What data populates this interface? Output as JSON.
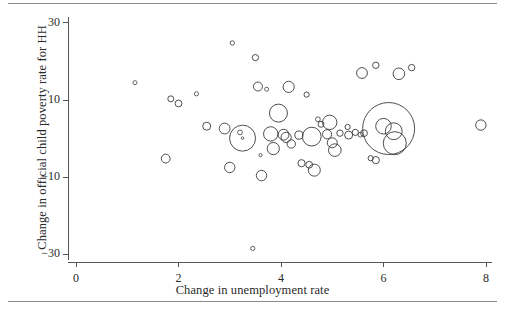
{
  "chart_data": {
    "type": "scatter",
    "title": "",
    "subtitle": "",
    "xlabel": "Change in unemployment rate",
    "ylabel": "Change in official child poverty rate for HH",
    "xlim": [
      -0.35,
      8.4
    ],
    "ylim": [
      -33,
      33
    ],
    "xticks": [
      0,
      2,
      4,
      6,
      8
    ],
    "xtick_labels": [
      "0",
      "2",
      "4",
      "6",
      "8"
    ],
    "yticks": [
      30,
      10,
      -10,
      -30
    ],
    "ytick_labels": [
      "30",
      "10",
      "−10",
      "−30"
    ],
    "grid": false,
    "legend": null,
    "marker_style": "open-circle",
    "size_encodes": "population weight (bubble area)",
    "points": [
      {
        "x": 1.15,
        "y": 14.5,
        "r": 2.0
      },
      {
        "x": 1.85,
        "y": 10.3,
        "r": 3.0
      },
      {
        "x": 2.0,
        "y": 9.1,
        "r": 3.4
      },
      {
        "x": 1.75,
        "y": -5.2,
        "r": 4.4
      },
      {
        "x": 2.35,
        "y": 11.6,
        "r": 2.1
      },
      {
        "x": 2.55,
        "y": 3.2,
        "r": 4.0
      },
      {
        "x": 2.9,
        "y": 2.6,
        "r": 5.4
      },
      {
        "x": 3.0,
        "y": -7.5,
        "r": 5.2
      },
      {
        "x": 3.05,
        "y": 24.8,
        "r": 2.2
      },
      {
        "x": 3.2,
        "y": 1.6,
        "r": 2.4
      },
      {
        "x": 3.25,
        "y": 0.1,
        "r": 13.0
      },
      {
        "x": 3.25,
        "y": 0.1,
        "r": 1.3
      },
      {
        "x": 3.45,
        "y": -28.5,
        "r": 2.1
      },
      {
        "x": 3.5,
        "y": 21.0,
        "r": 3.1
      },
      {
        "x": 3.55,
        "y": 13.5,
        "r": 4.5
      },
      {
        "x": 3.62,
        "y": -9.6,
        "r": 5.2
      },
      {
        "x": 3.6,
        "y": -4.3,
        "r": 1.6
      },
      {
        "x": 3.72,
        "y": 12.8,
        "r": 2.0
      },
      {
        "x": 3.8,
        "y": 1.2,
        "r": 7.2
      },
      {
        "x": 3.85,
        "y": -2.6,
        "r": 6.1
      },
      {
        "x": 3.95,
        "y": 6.6,
        "r": 9.0
      },
      {
        "x": 4.05,
        "y": 1.0,
        "r": 5.4
      },
      {
        "x": 4.1,
        "y": 0.3,
        "r": 5.1
      },
      {
        "x": 4.15,
        "y": 13.4,
        "r": 5.6
      },
      {
        "x": 4.2,
        "y": -1.4,
        "r": 4.2
      },
      {
        "x": 4.35,
        "y": 0.9,
        "r": 4.1
      },
      {
        "x": 4.4,
        "y": -6.4,
        "r": 3.6
      },
      {
        "x": 4.55,
        "y": -6.8,
        "r": 3.4
      },
      {
        "x": 4.5,
        "y": 11.4,
        "r": 2.6
      },
      {
        "x": 4.6,
        "y": 0.5,
        "r": 9.4
      },
      {
        "x": 4.65,
        "y": -8.2,
        "r": 6.0
      },
      {
        "x": 4.72,
        "y": 5.0,
        "r": 2.4
      },
      {
        "x": 4.78,
        "y": 3.7,
        "r": 3.0
      },
      {
        "x": 4.9,
        "y": 1.1,
        "r": 4.6
      },
      {
        "x": 4.95,
        "y": 4.2,
        "r": 7.2
      },
      {
        "x": 5.0,
        "y": -1.1,
        "r": 5.0
      },
      {
        "x": 5.05,
        "y": -3.0,
        "r": 6.3
      },
      {
        "x": 5.15,
        "y": 1.4,
        "r": 3.2
      },
      {
        "x": 5.3,
        "y": 3.0,
        "r": 2.6
      },
      {
        "x": 5.32,
        "y": 0.9,
        "r": 4.0
      },
      {
        "x": 5.45,
        "y": 1.6,
        "r": 3.1
      },
      {
        "x": 5.55,
        "y": 1.0,
        "r": 2.4
      },
      {
        "x": 5.58,
        "y": 17.0,
        "r": 5.4
      },
      {
        "x": 5.85,
        "y": 19.0,
        "r": 3.2
      },
      {
        "x": 6.1,
        "y": 2.6,
        "r": 26.0
      },
      {
        "x": 6.0,
        "y": 3.2,
        "r": 7.8
      },
      {
        "x": 6.2,
        "y": 1.9,
        "r": 8.4
      },
      {
        "x": 6.22,
        "y": -1.2,
        "r": 11.5
      },
      {
        "x": 5.62,
        "y": 1.4,
        "r": 3.4
      },
      {
        "x": 5.75,
        "y": -5.1,
        "r": 2.6
      },
      {
        "x": 5.85,
        "y": -5.6,
        "r": 3.6
      },
      {
        "x": 6.3,
        "y": 16.8,
        "r": 5.8
      },
      {
        "x": 6.55,
        "y": 18.4,
        "r": 3.2
      },
      {
        "x": 7.9,
        "y": 3.5,
        "r": 5.2
      }
    ]
  },
  "axis": {
    "stroke_color": "#555555"
  }
}
